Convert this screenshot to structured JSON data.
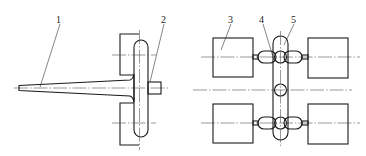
{
  "figure": {
    "left_view": {
      "labels": [
        {
          "id": "1",
          "text": "1"
        },
        {
          "id": "2",
          "text": "2"
        }
      ]
    },
    "right_view": {
      "labels": [
        {
          "id": "3",
          "text": "3"
        },
        {
          "id": "4",
          "text": "4"
        },
        {
          "id": "5",
          "text": "5"
        }
      ]
    },
    "colors": {
      "line": "#1a1a1a",
      "background": "#ffffff"
    }
  }
}
